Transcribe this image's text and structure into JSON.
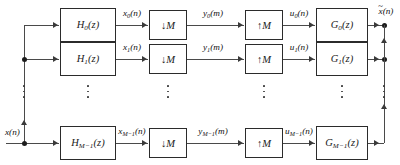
{
  "diagram": {
    "input_label": "x(n)",
    "output_label": "x̃(n)",
    "output_label_base": "x",
    "output_label_tail": "(n)",
    "output_tilde": "~",
    "analysis_blocks": [
      {
        "id": "H0",
        "label": "H₀(z)",
        "base": "H",
        "sub": "0",
        "arg": "(z)"
      },
      {
        "id": "H1",
        "label": "H₁(z)",
        "base": "H",
        "sub": "1",
        "arg": "(z)"
      },
      {
        "id": "HM1",
        "label": "Hₘ₋₁(z)",
        "base": "H",
        "sub": "M−1",
        "arg": "(z)"
      }
    ],
    "decimators": [
      {
        "id": "D0",
        "arrow": "↓",
        "factor": "M"
      },
      {
        "id": "D1",
        "arrow": "↓",
        "factor": "M"
      },
      {
        "id": "DM1",
        "arrow": "↓",
        "factor": "M"
      }
    ],
    "expanders": [
      {
        "id": "U0",
        "arrow": "↑",
        "factor": "M"
      },
      {
        "id": "U1",
        "arrow": "↑",
        "factor": "M"
      },
      {
        "id": "UM1",
        "arrow": "↑",
        "factor": "M"
      }
    ],
    "synthesis_blocks": [
      {
        "id": "G0",
        "label": "G₀(z)",
        "base": "G",
        "sub": "0",
        "arg": "(z)"
      },
      {
        "id": "G1",
        "label": "G₁(z)",
        "base": "G",
        "sub": "1",
        "arg": "(z)"
      },
      {
        "id": "GM1",
        "label": "Gₘ₋₁(z)",
        "base": "G",
        "sub": "M−1",
        "arg": "(z)"
      }
    ],
    "signals": {
      "subband_x": [
        {
          "base": "x",
          "sub": "0",
          "arg": "(n)",
          "text": "x₀(n)"
        },
        {
          "base": "x",
          "sub": "1",
          "arg": "(n)",
          "text": "x₁(n)"
        },
        {
          "base": "x",
          "sub": "M−1",
          "arg": "(n)",
          "text": "xₘ₋₁(n)"
        }
      ],
      "decimated_y": [
        {
          "base": "y",
          "sub": "0",
          "arg": "(m)",
          "text": "y₀(m)"
        },
        {
          "base": "y",
          "sub": "1",
          "arg": "(m)",
          "text": "y₁(m)"
        },
        {
          "base": "y",
          "sub": "M−1",
          "arg": "(m)",
          "text": "yₘ₋₁(m)"
        }
      ],
      "expanded_u": [
        {
          "base": "u",
          "sub": "0",
          "arg": "(n)",
          "text": "u₀(n)"
        },
        {
          "base": "u",
          "sub": "1",
          "arg": "(n)",
          "text": "u₁(n)"
        },
        {
          "base": "u",
          "sub": "M−1",
          "arg": "(n)",
          "text": "uₘ₋₁(n)"
        }
      ]
    },
    "ellipsis_note": "vertical dots indicate omitted intermediate channels",
    "colors": {
      "wire": "#4a4a4a",
      "block_border": "#2b2b2b",
      "text": "#111111",
      "background": "#ffffff"
    }
  }
}
